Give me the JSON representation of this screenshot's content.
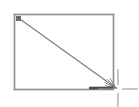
{
  "canvas": {
    "width": 139,
    "height": 107,
    "background_color": "#ffffff",
    "name": "drawing-canvas"
  },
  "shapes": {
    "rectangle": {
      "label": "rectangle-shape",
      "x": 14,
      "y": 14,
      "width": 99,
      "height": 75,
      "stroke_color": "#8c8c8c",
      "stroke_width": 1.6,
      "fill": "none"
    },
    "diagonal_arrow": {
      "label": "diagonal-arrow",
      "x1": 17,
      "y1": 17,
      "x2": 116,
      "y2": 88,
      "stroke_color": "#7a7a7a",
      "stroke_width": 1.1,
      "arrowhead": "fan"
    },
    "bottom_edge_highlight": {
      "label": "bottom-edge-highlight",
      "x1": 89,
      "y1": 88,
      "x2": 113,
      "y2": 88,
      "stroke_color": "#4a4a4a",
      "stroke_width": 2.6
    },
    "corner_handle": {
      "label": "top-left-corner-handle",
      "x": 16,
      "y": 16,
      "size": 5,
      "fill_color": "#6e6e6e"
    }
  },
  "cursor": {
    "label": "crosshair-cursor",
    "center_x": 118,
    "center_y": 89,
    "arm_length": 16,
    "gap": 4,
    "stroke_color": "#9a9a9a",
    "stroke_width": 1.1
  }
}
